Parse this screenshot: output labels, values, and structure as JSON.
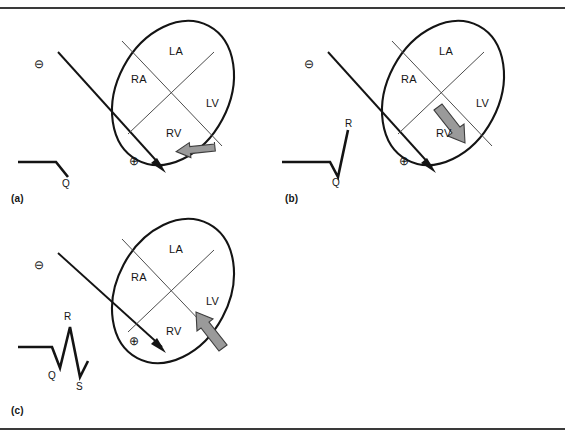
{
  "figure": {
    "panels": [
      {
        "id": "a",
        "label": "(a)",
        "ecg": {
          "name": "q-wave-trace",
          "wave_labels": [
            {
              "text": "Q",
              "x": 62,
              "y": 168
            }
          ]
        },
        "axis": {
          "negative_pole": "⊖",
          "positive_pole": "⊕",
          "negative_x": 36,
          "negative_y": 50,
          "positive_x": 131,
          "positive_y": 150
        },
        "heart": {
          "chambers": [
            {
              "code": "LA",
              "x": 169,
              "y": 35
            },
            {
              "code": "RA",
              "x": 131,
              "y": 63
            },
            {
              "code": "LV",
              "x": 206,
              "y": 87
            },
            {
              "code": "RV",
              "x": 166,
              "y": 117
            }
          ],
          "vector_direction": "left",
          "vector_color": "#9a9a9a"
        }
      },
      {
        "id": "b",
        "label": "(b)",
        "ecg": {
          "name": "qr-wave-trace",
          "wave_labels": [
            {
              "text": "R",
              "x": 63,
              "y": 112
            },
            {
              "text": "Q",
              "x": 50,
              "y": 167
            }
          ]
        },
        "axis": {
          "negative_pole": "⊖",
          "positive_pole": "⊕",
          "negative_x": 24,
          "negative_y": 50,
          "positive_x": 119,
          "positive_y": 150
        },
        "heart": {
          "chambers": [
            {
              "code": "LA",
              "x": 157,
              "y": 35
            },
            {
              "code": "RA",
              "x": 119,
              "y": 63
            },
            {
              "code": "LV",
              "x": 194,
              "y": 87
            },
            {
              "code": "RV",
              "x": 154,
              "y": 117
            }
          ],
          "vector_direction": "down-right",
          "vector_color": "#9a9a9a"
        }
      },
      {
        "id": "c",
        "label": "(c)",
        "ecg": {
          "name": "qrs-wave-trace",
          "wave_labels": [
            {
              "text": "R",
              "x": 64,
              "y": 110
            },
            {
              "text": "Q",
              "x": 48,
              "y": 158
            },
            {
              "text": "S",
              "x": 84,
              "y": 178
            }
          ]
        },
        "axis": {
          "negative_pole": "⊖",
          "positive_pole": "⊕",
          "negative_x": 36,
          "negative_y": 48,
          "positive_x": 131,
          "positive_y": 125
        },
        "heart": {
          "chambers": [
            {
              "code": "LA",
              "x": 169,
              "y": 28
            },
            {
              "code": "RA",
              "x": 131,
              "y": 56
            },
            {
              "code": "LV",
              "x": 206,
              "y": 80
            },
            {
              "code": "RV",
              "x": 166,
              "y": 110
            }
          ],
          "vector_direction": "up-left",
          "vector_color": "#9a9a9a"
        }
      }
    ],
    "colors": {
      "stroke": "#141414",
      "inner_stroke": "#4d4d4d",
      "arrow_fill": "#9a9a9a",
      "rule": "#3a3a3a",
      "background": "#ffffff"
    }
  }
}
